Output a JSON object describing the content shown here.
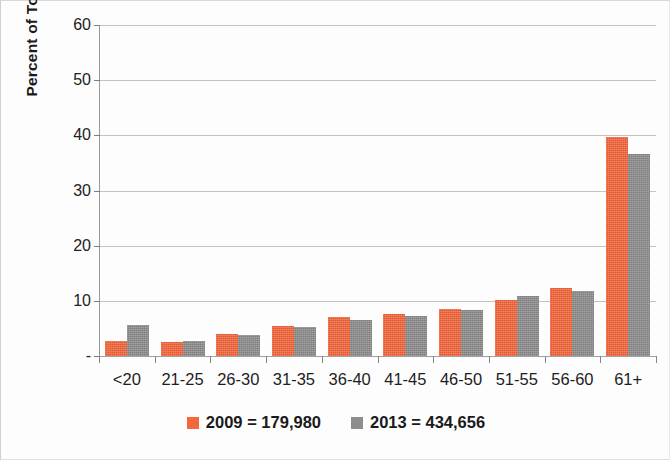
{
  "chart_data": {
    "type": "bar",
    "title": "",
    "subtitle": "",
    "xlabel": "",
    "ylabel": "Percent of Total",
    "ylim": [
      0,
      60
    ],
    "yticks": [
      0,
      10,
      20,
      30,
      40,
      50,
      60
    ],
    "ytick_labels": [
      "-",
      "10",
      "20",
      "30",
      "40",
      "50",
      "60"
    ],
    "grid": "horizontal",
    "legend_position": "bottom",
    "categories": [
      "<20",
      "21-25",
      "26-30",
      "31-35",
      "36-40",
      "41-45",
      "46-50",
      "51-55",
      "56-60",
      "61+"
    ],
    "series": [
      {
        "name": "2009 = 179,980",
        "year": "2009",
        "total": "179,980",
        "color": "#f4663c",
        "values": [
          2.7,
          2.5,
          4.0,
          5.5,
          7.0,
          7.6,
          8.6,
          10.1,
          12.4,
          39.7
        ]
      },
      {
        "name": "2013 = 434,656",
        "year": "2013",
        "total": "434,656",
        "color": "#8d8d8d",
        "values": [
          5.6,
          2.8,
          3.8,
          5.2,
          6.6,
          7.3,
          8.4,
          10.8,
          11.7,
          36.7
        ]
      }
    ]
  },
  "axes": {
    "y_title": "Percent of Total"
  },
  "colors": {
    "series_2009": "#f4663c",
    "series_2013": "#8d8d8d",
    "gridline": "#b9b9b9",
    "axis": "#9a9a9a",
    "text": "#1a1a1a",
    "background": "#fdfdfd"
  }
}
